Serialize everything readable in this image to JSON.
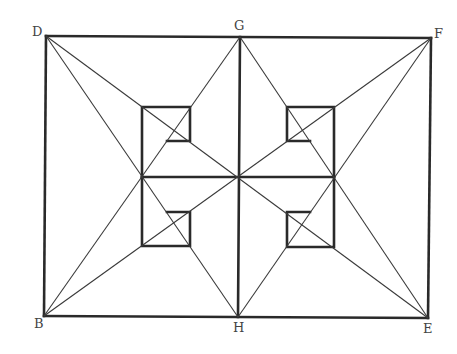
{
  "diagram": {
    "type": "geometric-figure",
    "labels": {
      "D": "D",
      "G": "G",
      "F": "F",
      "B": "B",
      "H": "H",
      "E": "E"
    },
    "points": {
      "D": [
        46,
        36
      ],
      "G": [
        240,
        37
      ],
      "F": [
        431,
        38
      ],
      "B": [
        44,
        316
      ],
      "H": [
        238,
        317
      ],
      "E": [
        428,
        318
      ],
      "center": [
        239,
        177
      ],
      "left_mid": [
        142,
        177
      ],
      "right_mid": [
        334,
        177
      ]
    },
    "colors": {
      "stroke": "#2a2a2a",
      "label": "#444444",
      "background": "#ffffff"
    }
  }
}
